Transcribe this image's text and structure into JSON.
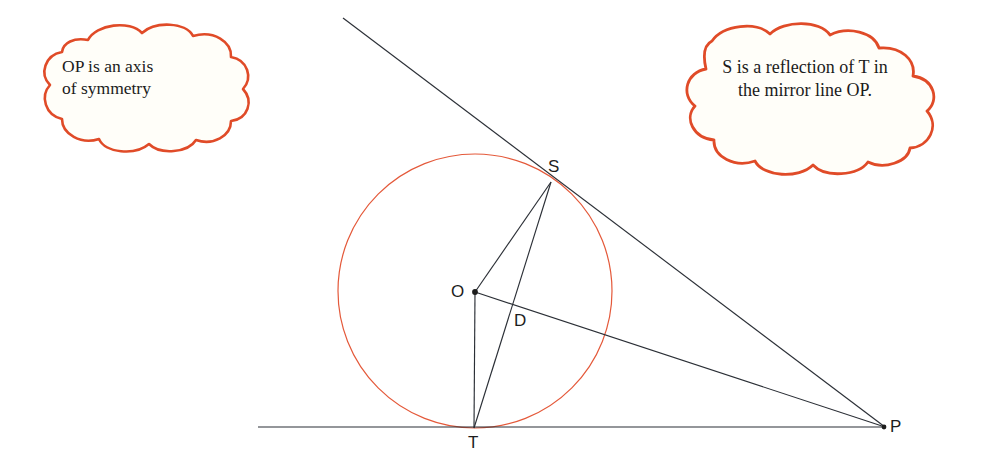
{
  "figure": {
    "colors": {
      "circle_stroke": "#e4593a",
      "callout_stroke": "#e04b28",
      "callout_fill": "#fffef9",
      "line_stroke": "#2b2f36",
      "text": "#1b1b1b"
    },
    "callouts": [
      {
        "name": "callout-left",
        "text": "OP is an axis\nof symmetry"
      },
      {
        "name": "callout-right",
        "text": "S is a reflection of T in\nthe mirror line OP."
      }
    ],
    "points": [
      {
        "label": "S",
        "x": 551,
        "y": 182,
        "role": "tangent-point-upper",
        "dot": false
      },
      {
        "label": "O",
        "x": 475,
        "y": 292,
        "role": "circle-centre",
        "dot": true
      },
      {
        "label": "D",
        "x": 528,
        "y": 316,
        "role": "intersection-of-ST-and-OP",
        "dot": false
      },
      {
        "label": "T",
        "x": 474,
        "y": 428,
        "role": "tangent-point-lower",
        "dot": false
      },
      {
        "label": "P",
        "x": 885,
        "y": 427,
        "role": "external-point",
        "dot": true
      }
    ],
    "circle": {
      "centre_x": 475,
      "centre_y": 291,
      "radius": 137
    },
    "segments": [
      {
        "name": "tangent-line-through-S",
        "from": [
          343,
          18
        ],
        "to": [
          885,
          427
        ]
      },
      {
        "name": "tangent-line-through-T",
        "from": [
          258,
          427
        ],
        "to": [
          885,
          427
        ]
      },
      {
        "name": "radius-O-to-S",
        "from": [
          475,
          292
        ],
        "to": [
          551,
          182
        ]
      },
      {
        "name": "radius-O-to-T",
        "from": [
          475,
          292
        ],
        "to": [
          474,
          428
        ]
      },
      {
        "name": "chord-S-to-T",
        "from": [
          551,
          182
        ],
        "to": [
          474,
          428
        ]
      },
      {
        "name": "line-O-to-P",
        "from": [
          475,
          292
        ],
        "to": [
          885,
          427
        ]
      }
    ]
  }
}
